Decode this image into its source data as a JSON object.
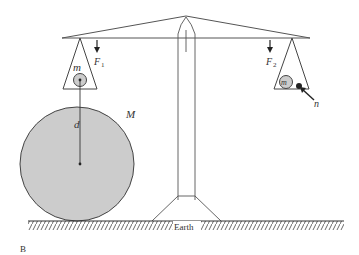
{
  "diagram": {
    "labels": {
      "small_mass": "m",
      "small_mass_right": "m",
      "big_mass": "M",
      "distance": "d",
      "force_left": "F",
      "force_left_sub": "1",
      "force_right": "F",
      "force_right_sub": "2",
      "extra_mass": "n",
      "ground": "Earth",
      "panel": "B"
    },
    "colors": {
      "line": "#333333",
      "sphere_fill": "#cccccc"
    }
  }
}
